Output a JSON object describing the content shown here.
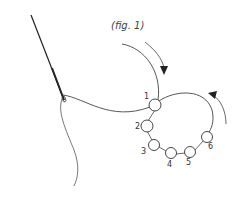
{
  "figure": {
    "caption": "(fig. 1)",
    "stroke_color": "#333333",
    "beads": [
      {
        "label": "1",
        "cx": 155,
        "cy": 105,
        "r": 6,
        "lx": 144,
        "ly": 92
      },
      {
        "label": "2",
        "cx": 147,
        "cy": 126,
        "r": 6,
        "lx": 135,
        "ly": 124
      },
      {
        "label": "3",
        "cx": 154,
        "cy": 145,
        "r": 5.5,
        "lx": 141,
        "ly": 148
      },
      {
        "label": "4",
        "cx": 171,
        "cy": 153,
        "r": 5.5,
        "lx": 168,
        "ly": 160
      },
      {
        "label": "5",
        "cx": 190,
        "cy": 152,
        "r": 5.5,
        "lx": 187,
        "ly": 158
      },
      {
        "label": "6",
        "cx": 207,
        "cy": 137,
        "r": 5.5,
        "lx": 208,
        "ly": 142
      }
    ]
  }
}
